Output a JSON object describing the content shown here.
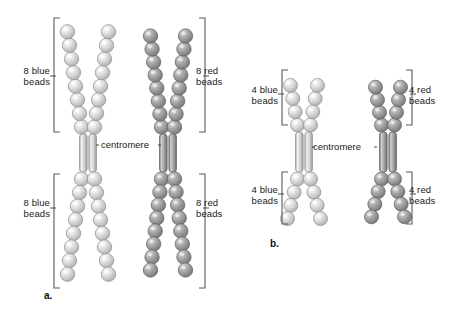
{
  "figure": {
    "background_color": "#ffffff",
    "bead_blue_color": "#d8d8d8",
    "bead_red_color": "#9a9a9a",
    "centromere_color": "#cfcfcf",
    "bracket_color": "#555555",
    "text_color": "#1a1a1a"
  },
  "panels": [
    {
      "id": "a",
      "letter": "a.",
      "centromere_label": "centromere",
      "labels": {
        "upper_left": "8 blue\nbeads",
        "upper_right": "8 red\nbeads",
        "lower_left": "8 blue\nbeads",
        "lower_right": "8 red\nbeads"
      },
      "chromosomes": [
        {
          "name": "blue-chromosome",
          "bead_color_name": "blue",
          "arms": [
            {
              "position": "upper-left",
              "bead_count": 8
            },
            {
              "position": "upper-right",
              "bead_count": 8
            },
            {
              "position": "lower-left",
              "bead_count": 8
            },
            {
              "position": "lower-right",
              "bead_count": 8
            }
          ]
        },
        {
          "name": "red-chromosome",
          "bead_color_name": "red",
          "arms": [
            {
              "position": "upper-left",
              "bead_count": 8
            },
            {
              "position": "upper-right",
              "bead_count": 8
            },
            {
              "position": "lower-left",
              "bead_count": 8
            },
            {
              "position": "lower-right",
              "bead_count": 8
            }
          ]
        }
      ]
    },
    {
      "id": "b",
      "letter": "b.",
      "centromere_label": "centromere",
      "labels": {
        "upper_left": "4 blue\nbeads",
        "upper_right": "4 red\nbeads",
        "lower_left": "4 blue\nbeads",
        "lower_right": "4 red\nbeads"
      },
      "chromosomes": [
        {
          "name": "blue-chromosome",
          "bead_color_name": "blue",
          "arms": [
            {
              "position": "upper-left",
              "bead_count": 4
            },
            {
              "position": "upper-right",
              "bead_count": 4
            },
            {
              "position": "lower-left",
              "bead_count": 4
            },
            {
              "position": "lower-right",
              "bead_count": 4
            }
          ]
        },
        {
          "name": "red-chromosome",
          "bead_color_name": "red",
          "arms": [
            {
              "position": "upper-left",
              "bead_count": 4
            },
            {
              "position": "upper-right",
              "bead_count": 4
            },
            {
              "position": "lower-left",
              "bead_count": 4
            },
            {
              "position": "lower-right",
              "bead_count": 4
            }
          ]
        }
      ]
    }
  ]
}
